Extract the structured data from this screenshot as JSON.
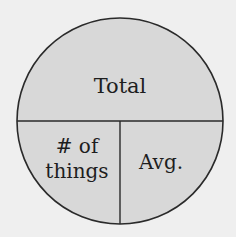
{
  "diagram": {
    "type": "formula-circle",
    "sections": {
      "top": {
        "label": "Total"
      },
      "bottom_left": {
        "line1": "# of",
        "line2": "things"
      },
      "bottom_right": {
        "label": "Avg."
      }
    },
    "colors": {
      "background": "#efefef",
      "fill": "#d8d8d8",
      "stroke": "#2a2a2a",
      "text": "#1e1e1e"
    }
  }
}
